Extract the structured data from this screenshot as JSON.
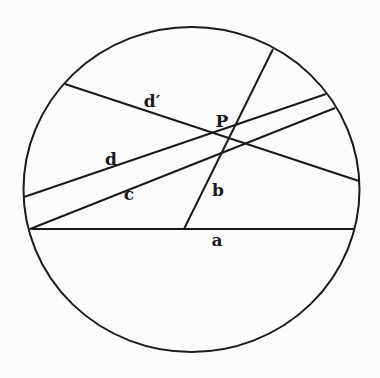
{
  "diagram": {
    "stroke_color": "#1a1a1a",
    "background": "#fcfcfc",
    "circle": {
      "cx": 191.5,
      "cy": 189.5,
      "rx": 168,
      "ry": 162.5
    },
    "point": {
      "label": "P",
      "x": 230,
      "y": 138,
      "label_x": 222,
      "label_y": 127
    },
    "chords": [
      {
        "id": "a",
        "label": "a",
        "x1": 30,
        "y1": 229,
        "x2": 354,
        "y2": 229,
        "label_x": 217,
        "label_y": 246
      },
      {
        "id": "b",
        "label": "b",
        "x1": 184,
        "y1": 229,
        "x2": 273,
        "y2": 49,
        "label_x": 218,
        "label_y": 196
      },
      {
        "id": "c",
        "label": "c",
        "x1": 30,
        "y1": 229,
        "x2": 335,
        "y2": 108,
        "label_x": 129,
        "label_y": 200
      },
      {
        "id": "d",
        "label": "d",
        "x1": 24,
        "y1": 197,
        "x2": 326,
        "y2": 94,
        "label_x": 111,
        "label_y": 165
      },
      {
        "id": "dprime",
        "label": "d′",
        "x1": 65,
        "y1": 84,
        "x2": 359,
        "y2": 181,
        "label_x": 152,
        "label_y": 107
      }
    ]
  }
}
